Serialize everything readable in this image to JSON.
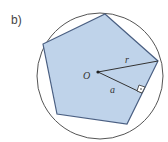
{
  "subfigure_label": "b)",
  "diagram": {
    "shape": "regular pentagon inscribed in circle",
    "labels": {
      "center": "O",
      "radius": "r",
      "apothem": "a"
    },
    "colors": {
      "fill": "#bfd3ea",
      "stroke": "#4a5f82",
      "circle": "#555555"
    }
  }
}
